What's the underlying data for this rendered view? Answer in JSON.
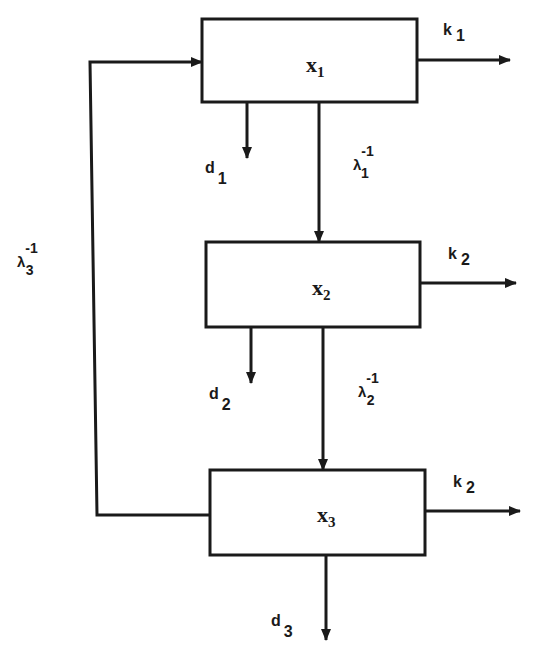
{
  "diagram": {
    "boxes": [
      {
        "id": "x1",
        "label": "x",
        "sub": "1"
      },
      {
        "id": "x2",
        "label": "x",
        "sub": "2"
      },
      {
        "id": "x3",
        "label": "x",
        "sub": "3"
      }
    ],
    "outputs_right": [
      {
        "label": "k",
        "sub": "1"
      },
      {
        "label": "k",
        "sub": "2"
      },
      {
        "label": "k",
        "sub": "2"
      }
    ],
    "outputs_down": [
      {
        "label": "d",
        "sub": "1"
      },
      {
        "label": "d",
        "sub": "2"
      },
      {
        "label": "d",
        "sub": "3"
      }
    ],
    "transfers": [
      {
        "label": "λ",
        "sup": "-1",
        "sub": "1"
      },
      {
        "label": "λ",
        "sup": "-1",
        "sub": "2"
      },
      {
        "label": "λ",
        "sup": "-1",
        "sub": "3"
      }
    ]
  }
}
